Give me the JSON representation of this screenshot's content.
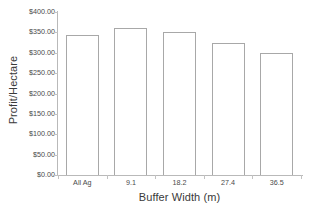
{
  "chart_data": {
    "type": "bar",
    "title": "",
    "xlabel": "Buffer Width (m)",
    "ylabel": "Profit/Hectare",
    "categories": [
      "All Ag",
      "9.1",
      "18.2",
      "27.4",
      "36.5"
    ],
    "values": [
      343.0,
      360.0,
      350.0,
      323.0,
      299.0
    ],
    "ylim": [
      0,
      400
    ],
    "ytick_values": [
      0,
      50,
      100,
      150,
      200,
      250,
      300,
      350,
      400
    ],
    "ytick_labels": [
      "$0.00",
      "$50.00",
      "$100.00",
      "$150.00",
      "$200.00",
      "$250.00",
      "$300.00",
      "$350.00",
      "$400.00"
    ],
    "grid": false,
    "legend": null,
    "bar_fill_color": "#ffffff",
    "bar_border_color": "#a8a8a8",
    "axis_color": "#b9b9b9",
    "background_color": "#ffffff"
  }
}
